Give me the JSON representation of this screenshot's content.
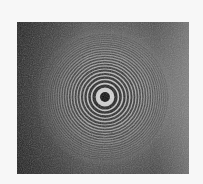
{
  "image": {
    "subject": "newton-rings-interference-pattern",
    "background_color": "#f7f7f7",
    "photo": {
      "x": 17,
      "y": 22,
      "width": 172,
      "height": 152
    },
    "ring_center": {
      "x": 88,
      "y": 75
    },
    "center_spot": {
      "radius": 5,
      "color": "#0a0a0a"
    },
    "rings": [
      {
        "r": 11,
        "w": 3.2
      },
      {
        "r": 15.5,
        "w": 2.6
      },
      {
        "r": 19.5,
        "w": 2.3
      },
      {
        "r": 23,
        "w": 2.1
      },
      {
        "r": 26.5,
        "w": 1.9
      },
      {
        "r": 29.5,
        "w": 1.8
      },
      {
        "r": 32.5,
        "w": 1.7
      },
      {
        "r": 35.3,
        "w": 1.6
      },
      {
        "r": 38,
        "w": 1.5
      },
      {
        "r": 40.6,
        "w": 1.4
      },
      {
        "r": 43.1,
        "w": 1.3
      },
      {
        "r": 45.5,
        "w": 1.25
      },
      {
        "r": 47.9,
        "w": 1.2
      },
      {
        "r": 50.2,
        "w": 1.1
      },
      {
        "r": 52.4,
        "w": 1.05
      },
      {
        "r": 54.6,
        "w": 1.0
      },
      {
        "r": 56.7,
        "w": 0.95
      },
      {
        "r": 58.8,
        "w": 0.9
      },
      {
        "r": 60.8,
        "w": 0.85
      },
      {
        "r": 62.8,
        "w": 0.8
      }
    ]
  }
}
